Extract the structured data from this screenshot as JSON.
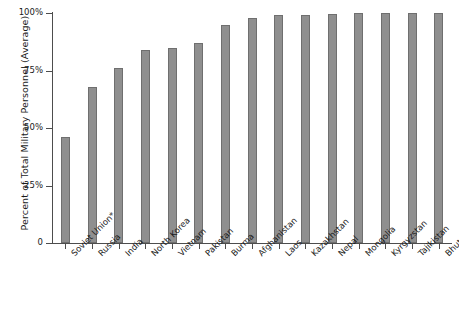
{
  "chart_data": {
    "type": "bar",
    "title": "",
    "subtitle": "",
    "xlabel": "",
    "ylabel": "Percent of Total Military Personnel (Average)",
    "ylim": [
      0,
      100
    ],
    "yticks": [
      0,
      25,
      50,
      75,
      100
    ],
    "ytick_labels": [
      "0",
      "25%",
      "50%",
      "75%",
      "100%"
    ],
    "grid": false,
    "legend": "none",
    "bar_color": "#8f8f8f",
    "bar_edge_color": "#6f6f6f",
    "axis_color": "#4d4d4d",
    "background_color": "#ffffff",
    "categories": [
      "Soviet Union*",
      "Russia",
      "India",
      "North Korea",
      "Vietnam",
      "Pakistan",
      "Burma",
      "Afghanistan",
      "Laos",
      "Kazakhstan",
      "Nepal",
      "Mongolia",
      "Kyrgyzstan",
      "Tajikistan",
      "Bhutan"
    ],
    "values": [
      46,
      68,
      76,
      84,
      85,
      87,
      95,
      98,
      99,
      99,
      99.5,
      100,
      100,
      100,
      100
    ],
    "footnote": "*"
  }
}
